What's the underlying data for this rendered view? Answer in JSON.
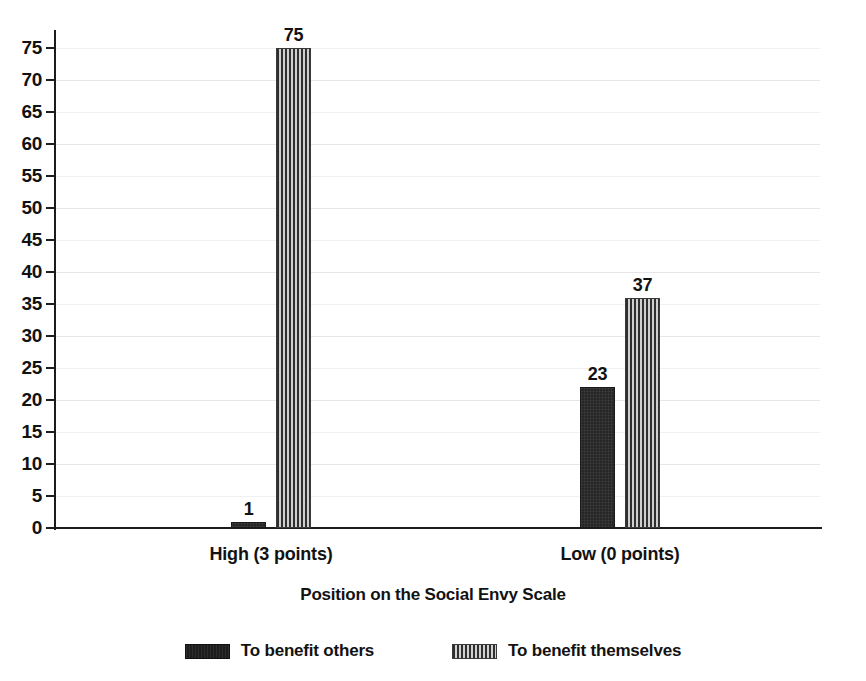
{
  "chart_data": {
    "type": "bar",
    "title": "",
    "xlabel": "Position on the Social Envy Scale",
    "ylabel": "",
    "categories": [
      "High (3 points)",
      "Low (0 points)"
    ],
    "series": [
      {
        "name": "To benefit others",
        "pattern": "solid",
        "values": [
          1,
          23
        ],
        "plotted_values": [
          1,
          22
        ]
      },
      {
        "name": "To benefit themselves",
        "pattern": "vertical-stripes",
        "values": [
          75,
          37
        ],
        "plotted_values": [
          75,
          36
        ]
      }
    ],
    "ylim": [
      0,
      75
    ],
    "ytick_step": 5,
    "yticks": [
      0,
      5,
      10,
      15,
      20,
      25,
      30,
      35,
      40,
      45,
      50,
      55,
      60,
      65,
      70,
      75
    ],
    "grid": true,
    "legend_position": "bottom",
    "data_labels": [
      "1",
      "75",
      "23",
      "37"
    ],
    "colors": {
      "bar_solid": "#262626",
      "bar_striped_dark": "#2f2f2f",
      "bar_striped_light": "#cfcfcf",
      "axis": "#1c1c1c",
      "gridline": "#e6e6e8",
      "text": "#121212",
      "background": "#ffffff"
    }
  }
}
